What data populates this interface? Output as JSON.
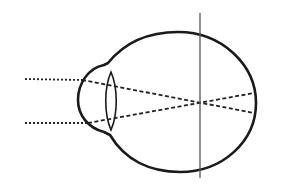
{
  "diagram": {
    "colors": {
      "outline": "#1a1a1a",
      "rays": "#222222",
      "reference_line": "#555555",
      "background": "#ffffff"
    },
    "elements": {
      "eyeball": {
        "shape": "oval-globe-with-corneal-bulge"
      },
      "lens": {
        "shape": "biconvex"
      },
      "incoming_rays": {
        "count": 2,
        "style": "dotted",
        "y": [
          79,
          123
        ]
      },
      "refracted_rays": {
        "count": 2,
        "style": "dashed",
        "cross_point": [
          201,
          103
        ]
      },
      "reference_line": {
        "orientation": "vertical",
        "x": 200
      }
    }
  }
}
